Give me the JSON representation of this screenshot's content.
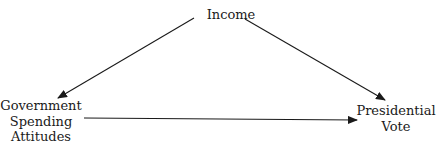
{
  "diagram": {
    "type": "causal-path-diagram",
    "nodes": {
      "income": {
        "label": "Income"
      },
      "government_spending_attitudes": {
        "lines": [
          "Government",
          "Spending",
          "Attitudes"
        ]
      },
      "presidential_vote": {
        "lines": [
          "Presidential",
          "Vote"
        ]
      }
    },
    "edges": [
      {
        "from": "Income",
        "to": "Government Spending Attitudes"
      },
      {
        "from": "Income",
        "to": "Presidential Vote"
      },
      {
        "from": "Government Spending Attitudes",
        "to": "Presidential Vote"
      }
    ],
    "colors": {
      "line": "#1a1a1a",
      "text": "#1a1a1a",
      "background": "#ffffff"
    }
  }
}
